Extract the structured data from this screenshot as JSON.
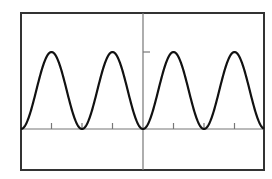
{
  "chart_data": {
    "type": "line",
    "title": "",
    "xlabel": "",
    "ylabel": "",
    "function": "y = sin^2(x)",
    "xlim": [
      -4.0,
      4.0
    ],
    "ylim": [
      -0.53,
      1.51
    ],
    "x_tick_spacing": 1.5708,
    "x_ticks": [
      -6.2832,
      -4.7124,
      -3.1416,
      -1.5708,
      0,
      1.5708,
      3.1416,
      4.7124,
      6.2832
    ],
    "y_ticks": [
      1
    ],
    "grid": false,
    "legend": null,
    "series": [
      {
        "name": "y",
        "color": "#111111",
        "x": [
          -6.2832,
          -4.7124,
          -3.1416,
          -1.5708,
          0,
          1.5708,
          3.1416,
          4.7124,
          6.2832
        ],
        "values": [
          0,
          1,
          0,
          1,
          0,
          1,
          0,
          1,
          0
        ]
      }
    ]
  },
  "style": {
    "frame_color": "#333333",
    "axis_color": "#777777",
    "curve_color": "#111111"
  }
}
